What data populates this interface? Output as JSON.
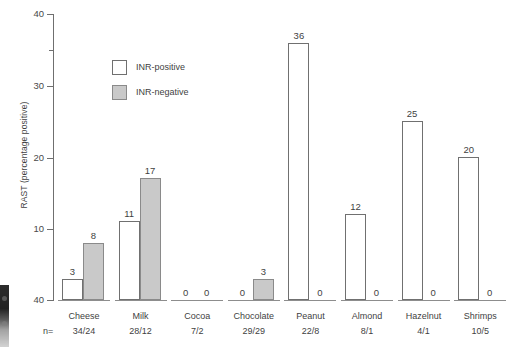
{
  "chart_data": {
    "type": "bar",
    "title": "",
    "xlabel": "",
    "ylabel": "RAST (percentage positive)",
    "ylim": [
      0,
      40
    ],
    "yticks": [
      "40",
      "30",
      "20",
      "10",
      "40"
    ],
    "grid": false,
    "legend_position": "inside-upper-left",
    "categories": [
      "Cheese",
      "Milk",
      "Cocoa",
      "Chocolate",
      "Peanut",
      "Almond",
      "Hazelnut",
      "Shrimps"
    ],
    "n_label": "n=",
    "n_values": [
      "34/24",
      "28/12",
      "7/2",
      "29/29",
      "22/8",
      "8/1",
      "4/1",
      "10/5"
    ],
    "series": [
      {
        "name": "INR-positive",
        "color": "#ffffff",
        "values": [
          3,
          11,
          0,
          0,
          36,
          12,
          25,
          20
        ],
        "labels": [
          "3",
          "11",
          "0",
          "0",
          "36",
          "12",
          "25",
          "20"
        ]
      },
      {
        "name": "INR-negative",
        "color": "#c9c9c9",
        "values": [
          8,
          17,
          0,
          3,
          0,
          0,
          0,
          0
        ],
        "labels": [
          "8",
          "17",
          "0",
          "3",
          "0",
          "0",
          "0",
          "0"
        ]
      }
    ]
  },
  "legend": {
    "items": [
      {
        "label": "INR-positive",
        "swatch": "white-square"
      },
      {
        "label": "INR-negative",
        "swatch": "gray-square"
      }
    ]
  },
  "axis": {
    "y_title": "RAST (percentage positive)",
    "ticks": [
      {
        "label": "40",
        "value": 40
      },
      {
        "label": "",
        "value": 35
      },
      {
        "label": "30",
        "value": 30
      },
      {
        "label": "20",
        "value": 20
      },
      {
        "label": "10",
        "value": 10
      },
      {
        "label": "40",
        "value": 0
      }
    ]
  },
  "colors": {
    "bar_positive_fill": "#ffffff",
    "bar_positive_stroke": "#707070",
    "bar_negative_fill": "#c9c9c9",
    "bar_negative_stroke": "#8a8a8a",
    "axis": "#6f6f6f",
    "text": "#3f3f3f"
  }
}
